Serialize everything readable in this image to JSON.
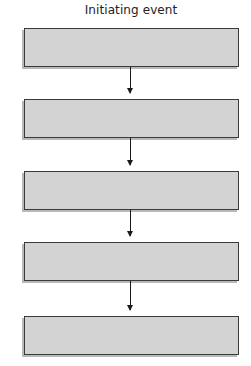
{
  "diagram": {
    "title": "Initiating event",
    "type": "flowchart-vertical",
    "colors": {
      "box_fill": "#d3d3d3",
      "box_border": "#3a3a3a",
      "arrow": "#1a1a1a"
    },
    "boxes": [
      {
        "label": ""
      },
      {
        "label": ""
      },
      {
        "label": ""
      },
      {
        "label": ""
      },
      {
        "label": ""
      }
    ],
    "arrows": [
      {
        "from": 0,
        "to": 1
      },
      {
        "from": 1,
        "to": 2
      },
      {
        "from": 2,
        "to": 3
      },
      {
        "from": 3,
        "to": 4
      }
    ]
  }
}
